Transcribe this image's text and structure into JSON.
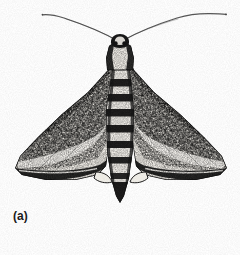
{
  "figure": {
    "label": "(a)",
    "style": "black-and-white scanned line illustration / halftone",
    "background_color": "#fefefe",
    "ink_color": "#171717",
    "midtone_color": "#5d5d5d",
    "pale_color": "#f2f0ec",
    "width": 240,
    "height": 255
  },
  "anatomy": {
    "antennae": {
      "name": "antennae",
      "count": 2,
      "description": "long thin filiform antennae sweeping outward and upward from the head",
      "left_tip": [
        42,
        15
      ],
      "right_tip": [
        226,
        14
      ],
      "origin": [
        120,
        40
      ]
    },
    "head": {
      "name": "head",
      "center": [
        120,
        44
      ],
      "description": "small dark head with pale crown patch between antennal bases"
    },
    "thorax": {
      "name": "thorax",
      "center": [
        120,
        62
      ],
      "description": "pale tapering thorax with dark lateral shoulder patches"
    },
    "abdomen": {
      "name": "abdomen",
      "top": 70,
      "tip": [
        120,
        202
      ],
      "description": "tapering banded abdomen ending in a pointed dark tip",
      "band_count": 7,
      "bands": [
        {
          "segment": 1,
          "y": 84,
          "tone": "dark"
        },
        {
          "segment": 2,
          "y": 99,
          "tone": "dark"
        },
        {
          "segment": 3,
          "y": 114,
          "tone": "dark"
        },
        {
          "segment": 4,
          "y": 129,
          "tone": "dark"
        },
        {
          "segment": 5,
          "y": 145,
          "tone": "dark"
        },
        {
          "segment": 6,
          "y": 161,
          "tone": "dark"
        },
        {
          "segment": 7,
          "y": 177,
          "tone": "dark"
        }
      ]
    },
    "forewing_left": {
      "name": "left forewing",
      "apex": [
        15,
        168
      ],
      "base": [
        112,
        62
      ],
      "description": "broad triangular forewing, mottled dark grain with pale oblique band and dark margin"
    },
    "forewing_right": {
      "name": "right forewing",
      "apex": [
        227,
        168
      ],
      "base": [
        128,
        62
      ],
      "description": "broad triangular forewing mirroring the left, mottled dark grain with pale oblique band and dark margin"
    },
    "hindwing_left": {
      "name": "left hindwing",
      "description": "small pale hindwing lobe just visible below the forewing margin"
    },
    "hindwing_right": {
      "name": "right hindwing",
      "description": "small pale hindwing lobe just visible below the forewing margin"
    }
  }
}
